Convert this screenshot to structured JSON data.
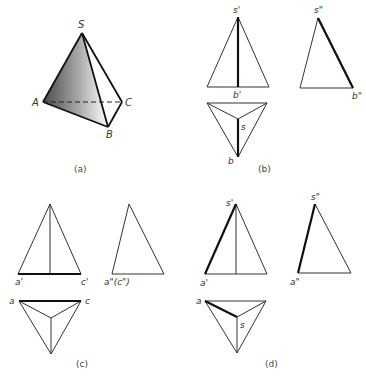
{
  "figure": {
    "panels": [
      {
        "id": "a",
        "caption": "(a)",
        "description": "Isometric view of triangular pyramid S-ABC",
        "labels": {
          "S": "S",
          "A": "A",
          "B": "B",
          "C": "C"
        },
        "highlighted_face": "SAB (shaded)",
        "hidden_edge": "AC (dashed)"
      },
      {
        "id": "b",
        "caption": "(b)",
        "description": "Three-view projections highlighting edge SB",
        "labels": {
          "front_apex": "s'",
          "front_base": "b'",
          "side_apex": "s\"",
          "side_base": "b\"",
          "top_center": "s",
          "top_bottom": "b"
        }
      },
      {
        "id": "c",
        "caption": "(c)",
        "description": "Three-view projections highlighting edge AC",
        "labels": {
          "front_left": "a'",
          "front_right": "c'",
          "side_base": "a\"(c\")",
          "top_left": "a",
          "top_right": "c"
        }
      },
      {
        "id": "d",
        "caption": "(d)",
        "description": "Three-view projections highlighting edge SA",
        "labels": {
          "front_apex": "s'",
          "front_left": "a'",
          "side_apex": "s\"",
          "side_base": "a\"",
          "top_left": "a",
          "top_center": "s"
        }
      }
    ]
  },
  "colors": {
    "line": "#333333",
    "highlight": "#111111",
    "shade_dark": "#4a4a4a",
    "shade_light": "#ffffff"
  }
}
